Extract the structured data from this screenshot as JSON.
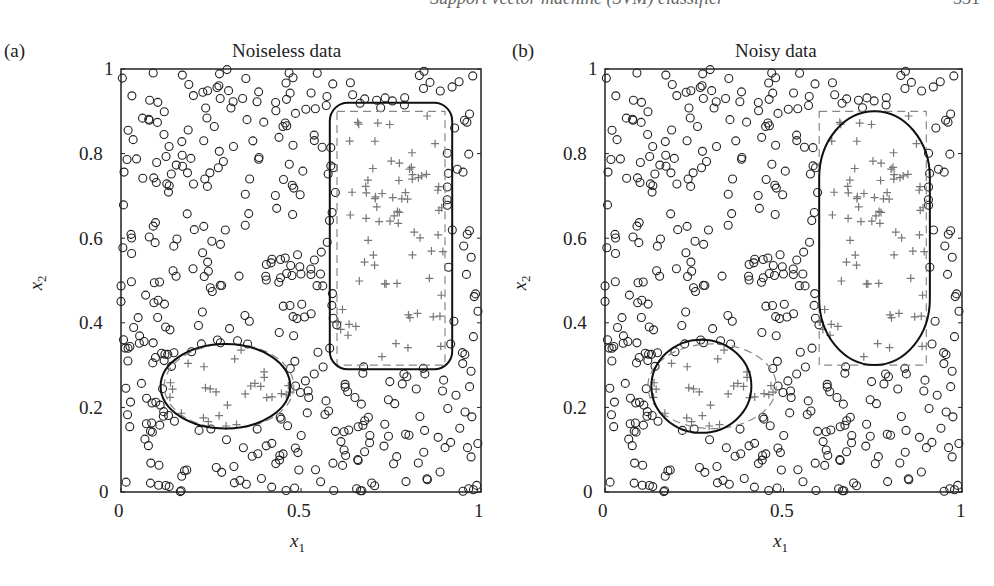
{
  "page_header": {
    "running_title": "Support vector machine (SVM) classifier",
    "page_number": "331"
  },
  "chart_data": [
    {
      "type": "scatter",
      "panel_label": "(a)",
      "title": "Noiseless data",
      "xlabel": "x1",
      "ylabel": "x2",
      "xlim": [
        0,
        1
      ],
      "ylim": [
        0,
        1
      ],
      "xticks": [
        "0",
        "0.5",
        "1"
      ],
      "yticks": [
        "0",
        "0.2",
        "0.4",
        "0.6",
        "0.8",
        "1"
      ],
      "series": [
        {
          "name": "class -1",
          "marker": "o",
          "color": "#222222"
        },
        {
          "name": "class +1",
          "marker": "+",
          "color": "#777777"
        }
      ],
      "true_regions": [
        {
          "shape": "rectangle",
          "x": [
            0.6,
            0.9
          ],
          "y": [
            0.3,
            0.9
          ],
          "style": "dashed"
        },
        {
          "shape": "ellipse",
          "cx": 0.3,
          "cy": 0.25,
          "rx": 0.18,
          "ry": 0.1,
          "style": "dashed"
        }
      ],
      "decision_boundaries": [
        {
          "shape": "rounded-rectangle",
          "x": [
            0.58,
            0.92
          ],
          "y": [
            0.29,
            0.92
          ]
        },
        {
          "shape": "ellipse",
          "cx": 0.29,
          "cy": 0.25,
          "rx": 0.18,
          "ry": 0.1
        }
      ]
    },
    {
      "type": "scatter",
      "panel_label": "(b)",
      "title": "Noisy data",
      "xlabel": "x1",
      "ylabel": "x2",
      "xlim": [
        0,
        1
      ],
      "ylim": [
        0,
        1
      ],
      "xticks": [
        "0",
        "0.5",
        "1"
      ],
      "yticks": [
        "0",
        "0.2",
        "0.4",
        "0.6",
        "0.8",
        "1"
      ],
      "series": [
        {
          "name": "class -1",
          "marker": "o",
          "color": "#222222"
        },
        {
          "name": "class +1",
          "marker": "+",
          "color": "#777777"
        }
      ],
      "true_regions": [
        {
          "shape": "rectangle",
          "x": [
            0.6,
            0.9
          ],
          "y": [
            0.3,
            0.9
          ],
          "style": "dashed"
        },
        {
          "shape": "ellipse",
          "cx": 0.3,
          "cy": 0.25,
          "rx": 0.18,
          "ry": 0.1,
          "style": "dashed"
        }
      ],
      "decision_boundaries": [
        {
          "shape": "capsule",
          "x": [
            0.6,
            0.91
          ],
          "y": [
            0.3,
            0.9
          ]
        },
        {
          "shape": "ellipse",
          "cx": 0.27,
          "cy": 0.25,
          "rx": 0.14,
          "ry": 0.11
        }
      ]
    }
  ]
}
